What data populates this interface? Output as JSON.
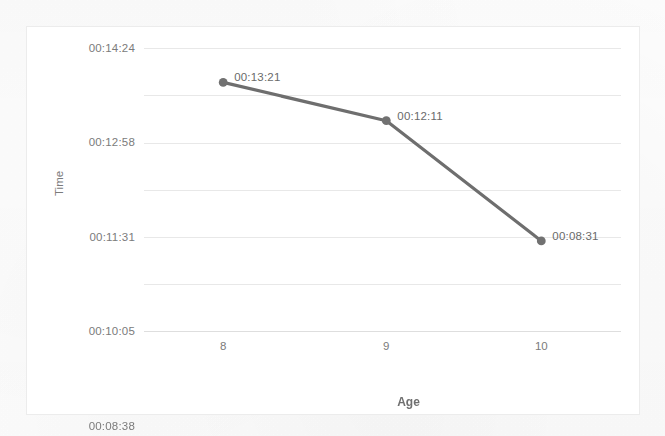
{
  "chart_data": {
    "type": "line",
    "title": "",
    "subtitle": "",
    "xlabel": "Age",
    "ylabel": "Time",
    "categories": [
      "8",
      "9",
      "10"
    ],
    "x": [
      8,
      9,
      10
    ],
    "values": [
      "00:13:21",
      "00:12:11",
      "00:08:31"
    ],
    "values_seconds": [
      801,
      731,
      511
    ],
    "point_labels": [
      "00:13:21",
      "00:12:11",
      "00:08:31"
    ],
    "series": [
      {
        "name": "Time",
        "values": [
          "00:13:21",
          "00:12:11",
          "00:08:31"
        ],
        "values_seconds": [
          801,
          731,
          511
        ]
      }
    ],
    "y_tick_labels": [
      "00:14:24",
      "00:12:58",
      "00:11:31",
      "00:10:05",
      "00:08:38",
      "00:07:12",
      "00:05:46"
    ],
    "y_tick_seconds": [
      864,
      778,
      691,
      605,
      518,
      432,
      346
    ],
    "x_tick_labels": [
      "8",
      "9",
      "10"
    ],
    "ylim_seconds": [
      346,
      864
    ],
    "grid": "horizontal",
    "legend": "none",
    "colors": {
      "line": "#6e6e6e",
      "marker": "#717171",
      "gridline": "#e8e8e8",
      "frame_border": "#ececec",
      "tick_label": "#7b7b7b",
      "axis_title": "#6f6f6f",
      "data_label": "#6a6a6a",
      "plot_background": "#ffffff"
    }
  },
  "axes": {
    "y_title": "Time",
    "x_title": "Age"
  }
}
